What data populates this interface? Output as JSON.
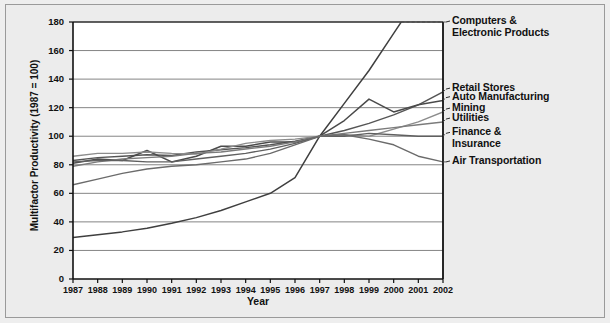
{
  "chart_data": {
    "type": "line",
    "title": "",
    "xlabel": "Year",
    "ylabel": "Multifactor Productivity (1987 = 100)",
    "x": [
      1987,
      1988,
      1989,
      1990,
      1991,
      1992,
      1993,
      1994,
      1995,
      1996,
      1997,
      1998,
      1999,
      2000,
      2001,
      2002
    ],
    "xlim": [
      1987,
      2002
    ],
    "ylim": [
      0,
      180
    ],
    "yticks": [
      0,
      20,
      40,
      60,
      80,
      100,
      120,
      140,
      160,
      180
    ],
    "xticks": [
      "1987",
      "1988",
      "1989",
      "1990",
      "1991",
      "1992",
      "1993",
      "1994",
      "1995",
      "1996",
      "1997",
      "1998",
      "1999",
      "2000",
      "2001",
      "2002"
    ],
    "grid": "horizontal",
    "legend_position": "right-inline",
    "series": [
      {
        "name": "Computers & Electronic Products",
        "color": "#3f3f3f",
        "width": 1.5,
        "label_y": 180,
        "values": [
          29,
          31,
          33,
          35.5,
          39,
          43,
          48,
          54,
          60,
          71,
          100,
          123,
          146,
          172,
          198,
          222
        ]
      },
      {
        "name": "Retail Stores",
        "color": "#555555",
        "width": 1.4,
        "label_y": 133,
        "values": [
          83,
          85,
          86,
          87,
          86.5,
          89,
          90.5,
          92,
          94,
          96.5,
          100,
          104,
          109,
          115,
          122,
          131
        ]
      },
      {
        "name": "Auto Manufacturing",
        "color": "#4a4a4a",
        "width": 1.5,
        "label_y": 127,
        "values": [
          81,
          84,
          83,
          90,
          82,
          86,
          93,
          93,
          96,
          96,
          100,
          111,
          126,
          117,
          122,
          125
        ]
      },
      {
        "name": "Mining",
        "color": "#8c8c8c",
        "width": 1.4,
        "label_y": 119,
        "values": [
          86,
          88,
          88,
          89,
          88,
          87.5,
          91,
          95,
          97,
          98,
          100,
          101,
          100,
          105,
          110,
          117
        ]
      },
      {
        "name": "Utilities",
        "color": "#7b7b7b",
        "width": 1.4,
        "label_y": 112,
        "values": [
          79,
          82,
          84,
          85,
          86,
          88,
          89,
          91,
          93,
          96,
          100,
          102,
          104,
          106,
          108,
          110
        ]
      },
      {
        "name": "Finance & Insurance",
        "color": "#606060",
        "width": 1.4,
        "label_y": 102,
        "values": [
          82,
          83,
          83,
          82,
          82,
          84,
          86,
          88,
          91,
          95,
          100,
          100,
          102,
          101,
          100,
          100
        ]
      },
      {
        "name": "Air Transportation",
        "color": "#6b6b6b",
        "width": 1.4,
        "label_y": 82,
        "values": [
          66,
          70,
          74,
          77,
          79,
          80,
          82,
          84,
          88,
          94,
          100,
          101,
          98,
          94,
          86,
          82
        ]
      }
    ]
  },
  "legend": [
    {
      "text": "Computers &",
      "text2": "Electronic Products"
    },
    {
      "text": "Retail Stores",
      "text2": ""
    },
    {
      "text": "Auto Manufacturing",
      "text2": ""
    },
    {
      "text": "Mining",
      "text2": ""
    },
    {
      "text": "Utilities",
      "text2": ""
    },
    {
      "text": "Finance &",
      "text2": "Insurance"
    },
    {
      "text": "Air Transportation",
      "text2": ""
    }
  ]
}
